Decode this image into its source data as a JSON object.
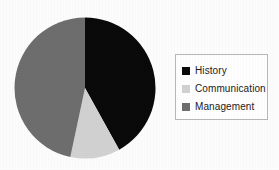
{
  "chart_data": {
    "type": "pie",
    "title": "",
    "labels": [
      "History",
      "Communication",
      "Management"
    ],
    "values": [
      42,
      11,
      47
    ],
    "colors": [
      "#0a0a0a",
      "#d2d2d2",
      "#6e6e6e"
    ],
    "start_angle_deg": 0,
    "direction": "clockwise",
    "legend_position": "right",
    "grid": false,
    "slices": [
      {
        "label": "History",
        "value": 42,
        "color": "#0a0a0a",
        "start_deg": 0,
        "end_deg": 151
      },
      {
        "label": "Communication",
        "value": 11,
        "color": "#d2d2d2",
        "start_deg": 151,
        "end_deg": 192
      },
      {
        "label": "Management",
        "value": 47,
        "color": "#6e6e6e",
        "start_deg": 192,
        "end_deg": 360
      }
    ]
  },
  "legend": {
    "items": [
      {
        "label": "History",
        "color": "#0a0a0a"
      },
      {
        "label": "Communication",
        "color": "#d2d2d2"
      },
      {
        "label": "Management",
        "color": "#6e6e6e"
      }
    ],
    "border_color": "#b9b9b9",
    "background_color": "#ffffff"
  },
  "figure": {
    "background_color": "#fdfdfd"
  }
}
